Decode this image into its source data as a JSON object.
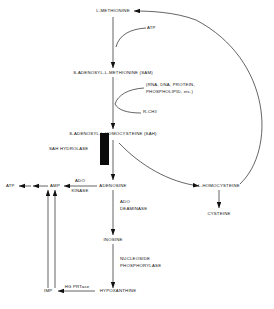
{
  "diagram": {
    "nodes": {
      "methionine": "L-METHIONINE",
      "sam": "S-ADENOSYL-L-METHIONINE (SAM)",
      "sah": "S-ADENOSYL-L-HOMOCYSTEINE (SAH)",
      "adenosine": "ADENOSINE",
      "homocysteine": "L-HOMOCYSTEINE",
      "cysteine": "CYSTEINE",
      "inosine": "INOSINE",
      "hypoxanthine": "HYPOXANTHINE",
      "imp": "IMP",
      "amp": "AMP",
      "atp": "ATP"
    },
    "cofactors": {
      "atp_cofactor": "ATP",
      "acceptors_line1": "(RNA, DNA, PROTEIN,",
      "acceptors_line2": "PHOSPHOLIPID, etc.)",
      "methylated_product": "R-CH",
      "methylated_product_sub": "3"
    },
    "enzymes": {
      "sah_hydrolase": "SAH HYDROLASE",
      "ado_kinase_line1": "ADO",
      "ado_kinase_line2": "KINASE",
      "ado_deaminase_line1": "ADO",
      "ado_deaminase_line2": "DEAMINASE",
      "nucleoside_phosphorylase_line1": "NUCLEOSIDE",
      "nucleoside_phosphorylase_line2": "PHOSPHORYLASE",
      "hg_prtase": "HG PRTase"
    },
    "colors": {
      "stroke": "#111111",
      "enzyme_block": "#0b0b0b",
      "background": "#ffffff"
    }
  }
}
